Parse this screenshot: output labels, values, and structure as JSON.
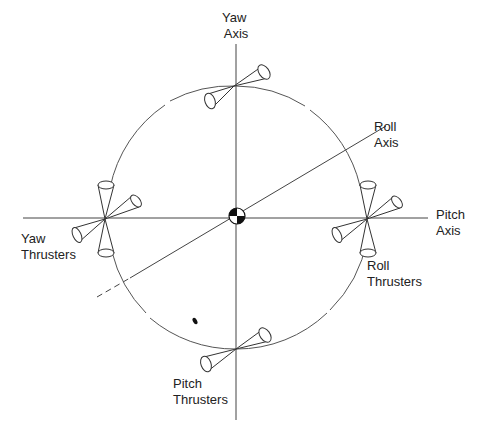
{
  "diagram": {
    "type": "spacecraft attitude control thruster layout",
    "labels": {
      "yaw_axis": [
        "Yaw",
        "Axis"
      ],
      "roll_axis": [
        "Roll",
        "Axis"
      ],
      "pitch_axis": [
        "Pitch",
        "Axis"
      ],
      "yaw_thrusters": [
        "Yaw",
        "Thrusters"
      ],
      "roll_thrusters": [
        "Roll",
        "Thrusters"
      ],
      "pitch_thrusters": [
        "Pitch",
        "Thrusters"
      ]
    },
    "center_symbol": "center-of-gravity",
    "colors": {
      "line": "#444444",
      "text": "#222222",
      "background": "#ffffff"
    }
  }
}
